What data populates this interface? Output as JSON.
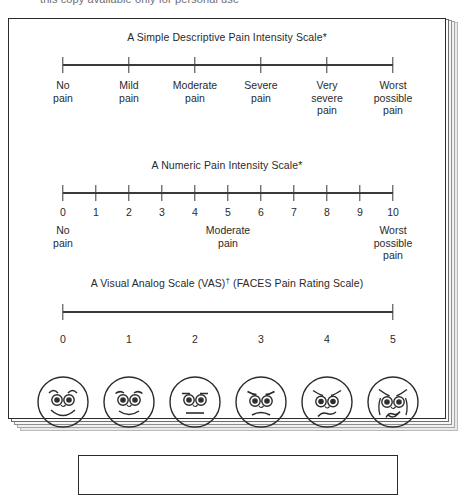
{
  "top_clipped_text": "this copy available only for personal use",
  "card": {
    "sections": [
      {
        "id": "simple-descriptive",
        "title": "A Simple Descriptive Pain Intensity Scale*",
        "title_suffix": "",
        "scale_type": "categorical",
        "ticks": 6,
        "labels": [
          "No\npain",
          "Mild\npain",
          "Moderate\npain",
          "Severe\npain",
          "Very\nsevere\npain",
          "Worst\npossible\npain"
        ]
      },
      {
        "id": "numeric",
        "title": "A Numeric Pain Intensity Scale*",
        "title_suffix": "",
        "scale_type": "numeric",
        "numbers": [
          "0",
          "1",
          "2",
          "3",
          "4",
          "5",
          "6",
          "7",
          "8",
          "9",
          "10"
        ],
        "anchors": [
          {
            "at": 0,
            "text": "No\npain"
          },
          {
            "at": 5,
            "text": "Moderate\npain"
          },
          {
            "at": 10,
            "text": "Worst\npossible\npain"
          }
        ]
      },
      {
        "id": "vas-faces",
        "title": "A Visual Analog Scale (VAS)",
        "title_suffix": " (FACES Pain Rating Scale)",
        "title_dagger": "†",
        "scale_type": "continuous",
        "face_numbers": [
          "0",
          "1",
          "2",
          "3",
          "4",
          "5"
        ],
        "face_expressions": [
          "broad-smile-face",
          "slight-smile-face",
          "neutral-face",
          "slight-frown-face",
          "frown-face",
          "crying-face"
        ]
      }
    ]
  },
  "chart_data": {
    "type": "table",
    "scales": [
      {
        "name": "A Simple Descriptive Pain Intensity Scale*",
        "type": "categorical",
        "categories": [
          "No pain",
          "Mild pain",
          "Moderate pain",
          "Severe pain",
          "Very severe pain",
          "Worst possible pain"
        ],
        "positions": [
          0,
          1,
          2,
          3,
          4,
          5
        ],
        "xlim": [
          0,
          5
        ],
        "grid": false
      },
      {
        "name": "A Numeric Pain Intensity Scale*",
        "type": "numeric",
        "tick_labels": [
          "0",
          "1",
          "2",
          "3",
          "4",
          "5",
          "6",
          "7",
          "8",
          "9",
          "10"
        ],
        "values": [
          0,
          1,
          2,
          3,
          4,
          5,
          6,
          7,
          8,
          9,
          10
        ],
        "anchor_text": {
          "0": "No pain",
          "5": "Moderate pain",
          "10": "Worst possible pain"
        },
        "xlim": [
          0,
          10
        ],
        "grid": false
      },
      {
        "name": "A Visual Analog Scale (VAS)† (FACES Pain Rating Scale)",
        "type": "continuous",
        "tick_labels": [
          "0",
          "5"
        ],
        "face_scale_labels": [
          "0",
          "1",
          "2",
          "3",
          "4",
          "5"
        ],
        "face_scale_values": [
          0,
          1,
          2,
          3,
          4,
          5
        ],
        "xlim": [
          0,
          5
        ],
        "grid": false
      }
    ],
    "colors": {
      "line": "#3a3a3a",
      "text": "#2a2a2a",
      "background": "#ffffff"
    }
  }
}
